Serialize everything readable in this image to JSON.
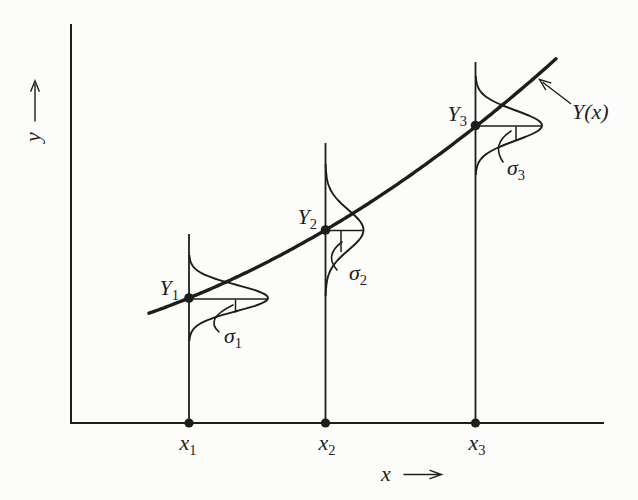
{
  "figure": {
    "background_color": "#fcfcfa",
    "ink_color": "#1d1d1b"
  },
  "axes": {
    "x_label": "x",
    "y_label": "y"
  },
  "curve": {
    "label": "Y(x)"
  },
  "points": [
    {
      "x_tick": {
        "base": "x",
        "sub": "1"
      },
      "mean": {
        "base": "Y",
        "sub": "1"
      },
      "sigma": {
        "base": "σ",
        "sub": "1"
      }
    },
    {
      "x_tick": {
        "base": "x",
        "sub": "2"
      },
      "mean": {
        "base": "Y",
        "sub": "2"
      },
      "sigma": {
        "base": "σ",
        "sub": "2"
      }
    },
    {
      "x_tick": {
        "base": "x",
        "sub": "3"
      },
      "mean": {
        "base": "Y",
        "sub": "3"
      },
      "sigma": {
        "base": "σ",
        "sub": "3"
      }
    }
  ],
  "icons": {
    "x_axis_arrow": "right-arrow",
    "y_axis_arrow": "up-arrow",
    "curve_pointer": "up-left-arrow"
  }
}
